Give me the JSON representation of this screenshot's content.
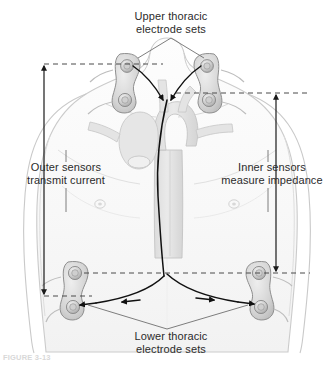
{
  "figure": {
    "background_color": "#ffffff",
    "width": 334,
    "height": 367
  },
  "labels": {
    "upper_electrodes": "Upper thoracic\nelectrode sets",
    "lower_electrodes": "Lower thoracic\nelectrode sets",
    "outer_sensors": "Outer sensors\ntransmit current",
    "inner_sensors": "Inner sensors\nmeasure impedance"
  },
  "caption": "FIGURE 3-13",
  "colors": {
    "text": "#2b2b2b",
    "leader_line": "#6f6f6f",
    "dashed_line": "#4a4a4a",
    "arrow_line": "#1a1a1a",
    "signal_path": "#111111",
    "body_outline": "#c9c9c9",
    "body_fill": "#fbfbfb",
    "vessel_fill": "#e2e2e2",
    "vessel_stroke": "#c2c2c2",
    "electrode_body": "#d6d6d6",
    "electrode_stroke": "#8c8c8c",
    "electrode_hub": "#bfbfbf",
    "caption_text": "#d8d8d8"
  },
  "anatomy": {
    "view": "anterior chest and torso, shoulders and upper arms visible",
    "structures": [
      "neck",
      "clavicles",
      "shoulders",
      "upper arms",
      "chest wall",
      "nipples",
      "abdomen",
      "aortic arch",
      "ascending aorta",
      "descending aorta",
      "great vessels"
    ]
  },
  "electrodes": {
    "count_total": 8,
    "sets": [
      {
        "name": "upper-left-outer",
        "position_label": "upper thoracic outer (left neck)",
        "x": 128,
        "y": 66,
        "role": "transmit current"
      },
      {
        "name": "upper-left-inner",
        "position_label": "upper thoracic inner (left base of neck)",
        "x": 131,
        "y": 93,
        "role": "measure impedance"
      },
      {
        "name": "upper-right-outer",
        "position_label": "upper thoracic outer (right neck)",
        "x": 207,
        "y": 66,
        "role": "transmit current"
      },
      {
        "name": "upper-right-inner",
        "position_label": "upper thoracic inner (right base of neck)",
        "x": 204,
        "y": 93,
        "role": "measure impedance"
      },
      {
        "name": "lower-left-inner",
        "position_label": "lower thoracic inner (left lateral chest)",
        "x": 76,
        "y": 273,
        "role": "measure impedance"
      },
      {
        "name": "lower-left-outer",
        "position_label": "lower thoracic outer (left lower chest)",
        "x": 78,
        "y": 296,
        "role": "transmit current"
      },
      {
        "name": "lower-right-inner",
        "position_label": "lower thoracic inner (right lateral chest)",
        "x": 249,
        "y": 273,
        "role": "measure impedance"
      },
      {
        "name": "lower-right-outer",
        "position_label": "lower thoracic outer (right lower chest)",
        "x": 247,
        "y": 296,
        "role": "transmit current"
      }
    ]
  },
  "measurement_arrows": [
    {
      "name": "outer-sensor-span",
      "side": "left",
      "x": 44,
      "y_top": 64,
      "y_bottom": 296,
      "double_headed": true,
      "describes": "Outer sensors transmit current"
    },
    {
      "name": "inner-sensor-span",
      "side": "right",
      "x": 276,
      "y_top": 93,
      "y_bottom": 273,
      "double_headed": true,
      "describes": "Inner sensors measure impedance"
    }
  ],
  "dashed_guides": [
    {
      "name": "upper-outer-guide",
      "y": 64,
      "x_start": 44,
      "x_end": 163
    },
    {
      "name": "upper-inner-guide",
      "y": 93,
      "x_start": 176,
      "x_end": 310
    },
    {
      "name": "lower-inner-guide",
      "y": 273,
      "x_start": 84,
      "x_end": 310
    },
    {
      "name": "lower-outer-guide",
      "y": 296,
      "x_start": 44,
      "x_end": 92
    }
  ],
  "signal_paths": {
    "description": "Current flow arrows from upper electrode sets down the thorax and across the lower electrode sets",
    "arrow_count": 8
  }
}
